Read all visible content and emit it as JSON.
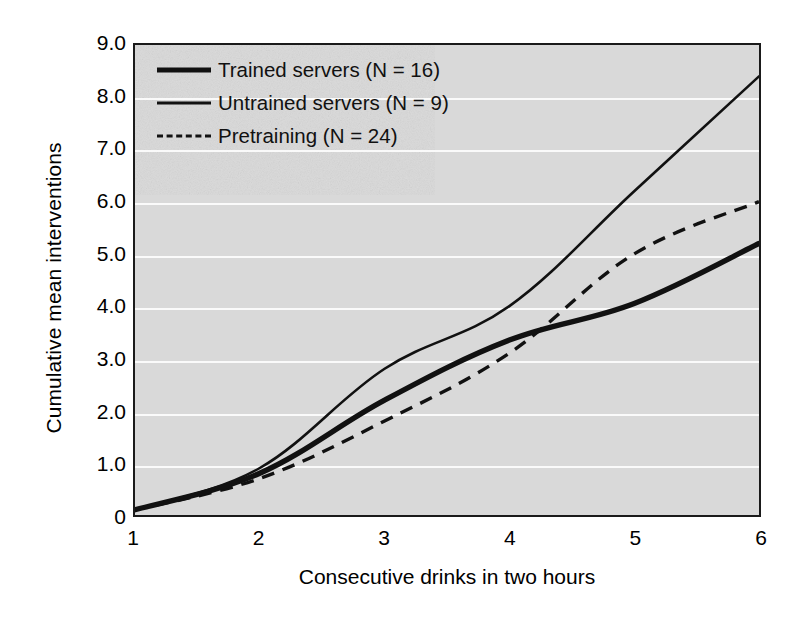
{
  "chart_data": {
    "type": "line",
    "title": "",
    "xlabel": "Consecutive drinks in two hours",
    "ylabel": "Cumulative mean interventions",
    "x": [
      1,
      2,
      3,
      4,
      5,
      6
    ],
    "xlim": [
      1,
      6
    ],
    "ylim": [
      0,
      9
    ],
    "xticks": [
      "1",
      "2",
      "3",
      "4",
      "5",
      "6"
    ],
    "yticks": [
      "0",
      "1.0",
      "2.0",
      "3.0",
      "4.0",
      "5.0",
      "6.0",
      "7.0",
      "8.0",
      "9.0"
    ],
    "grid": "horizontal",
    "legend_position": "upper-left-inside",
    "plot_background": "#d9d9d9",
    "gridline_color": "#fafafa",
    "line_color": "#111111",
    "series": [
      {
        "name": "Trained servers (N = 16)",
        "style": "solid-thick",
        "values": [
          0.1,
          0.8,
          2.2,
          3.35,
          4.05,
          5.2
        ]
      },
      {
        "name": "Untrained servers (N = 9)",
        "style": "solid-thin",
        "values": [
          0.1,
          0.9,
          2.8,
          4.0,
          6.2,
          8.4
        ]
      },
      {
        "name": "Pretraining (N = 24)",
        "style": "dashed",
        "values": [
          0.1,
          0.7,
          1.8,
          3.1,
          5.0,
          6.0
        ]
      }
    ]
  },
  "axes": {
    "y_title": "Cumulative mean interventions",
    "x_title": "Consecutive drinks in two hours",
    "y_tick_labels": [
      "9.0",
      "8.0",
      "7.0",
      "6.0",
      "5.0",
      "4.0",
      "3.0",
      "2.0",
      "1.0",
      "0"
    ],
    "x_tick_labels": [
      "1",
      "2",
      "3",
      "4",
      "5",
      "6"
    ]
  },
  "legend": {
    "items": [
      {
        "label": "Trained servers (N = 16)",
        "swatch": "solid-thick-line-icon"
      },
      {
        "label": "Untrained servers (N = 9)",
        "swatch": "solid-thin-line-icon"
      },
      {
        "label": "Pretraining (N = 24)",
        "swatch": "dashed-line-icon"
      }
    ]
  }
}
